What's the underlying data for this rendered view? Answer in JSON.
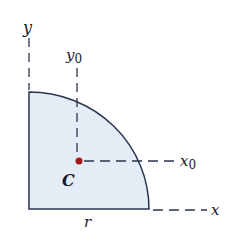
{
  "diagram": {
    "labels": {
      "y_axis": "y",
      "x_axis": "x",
      "y0_axis": "y",
      "y0_sub": "0",
      "x0_axis": "x",
      "x0_sub": "0",
      "centroid": "C",
      "radius": "r"
    },
    "colors": {
      "fill": "#e4edf6",
      "stroke": "#2a3550",
      "centroid_dot": "#a31a1a",
      "dashes": "#2a3550"
    }
  }
}
